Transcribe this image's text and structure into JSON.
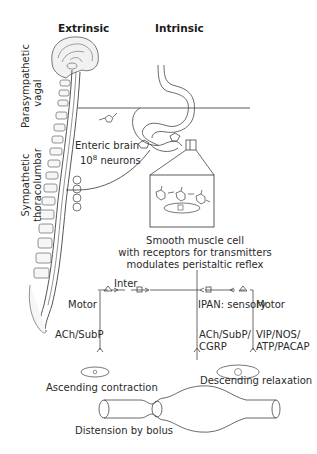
{
  "headers": {
    "extrinsic": "Extrinsic",
    "intrinsic": "Intrinsic"
  },
  "side_labels": {
    "parasympathetic": [
      "Parasympathetic",
      "vagal"
    ],
    "sympathetic": [
      "Sympathetic",
      "thoracolumbar"
    ]
  },
  "enteric": {
    "line1": "Enteric brain",
    "line2_base": "10",
    "line2_sup": "8",
    "line2_rest": " neurons"
  },
  "smooth_muscle": {
    "line1": "Smooth muscle cell",
    "line2": "with receptors for transmitters",
    "line3": "modulates peristaltic reflex"
  },
  "circuit": {
    "inter": "Inter",
    "motor_left": "Motor",
    "ipan": "IPAN: sensory",
    "motor_right": "Motor",
    "left_transmitters": "ACh/SubP",
    "mid_transmitters": [
      "ACh/SubP/",
      "CGRP"
    ],
    "right_transmitters": [
      "VIP/NOS/",
      "ATP/PACAP"
    ]
  },
  "gut_tube": {
    "ascending": "Ascending contraction",
    "descending": "Descending relaxation",
    "distension": "Distension by bolus"
  }
}
